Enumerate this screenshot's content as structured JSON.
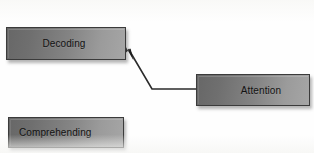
{
  "diagram": {
    "background_color": "#fefefe",
    "nodes": [
      {
        "id": "decoding",
        "label": "Decoding",
        "fill_dark": "#676767",
        "fill_light": "#a6a6a6",
        "border_color": "#3b3b3b",
        "text_color": "#121212"
      },
      {
        "id": "attention",
        "label": "Attention",
        "fill_dark": "#676767",
        "fill_light": "#a6a6a6",
        "border_color": "#3b3b3b",
        "text_color": "#121212"
      },
      {
        "id": "comprehending",
        "label": "Comprehending",
        "fill_dark": "#676767",
        "fill_light": "#a6a6a6",
        "border_color": "#3b3b3b",
        "text_color": "#121212"
      }
    ],
    "connectors": [
      {
        "id": "attention-to-decoding",
        "from": "attention",
        "to": "decoding",
        "style": "elbow-arrow",
        "color": "#2b2b2b",
        "arrowhead": "solid-filled",
        "points": "196,89 152,89 127,47",
        "arrow_tip": "125,45"
      }
    ]
  }
}
